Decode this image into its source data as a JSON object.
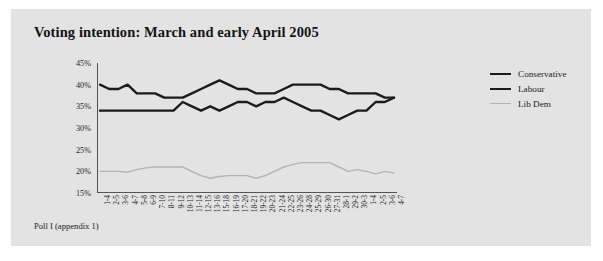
{
  "figure": {
    "title": "Voting intention: March and early April 2005",
    "caption": "Poll I (appendix 1)",
    "background": "#e3e3e3",
    "page_background": "#ffffff"
  },
  "legend": {
    "position": "right",
    "entries": [
      {
        "label": "Conservative",
        "color": "#1b1b1b",
        "width": 2.4
      },
      {
        "label": "Labour",
        "color": "#1b1b1b",
        "width": 2.4
      },
      {
        "label": "Lib Dem",
        "color": "#b3b3b3",
        "width": 1.4
      }
    ]
  },
  "chart_data": {
    "type": "line",
    "title": "Voting intention: March and early April 2005",
    "xlabel": "",
    "ylabel": "",
    "ylim": [
      15,
      45
    ],
    "yticks": [
      15,
      20,
      25,
      30,
      35,
      40,
      45
    ],
    "ytick_labels": [
      "15%",
      "20%",
      "25%",
      "30%",
      "35%",
      "40%",
      "45%"
    ],
    "grid": false,
    "legend_position": "right",
    "categories": [
      "1-4",
      "2-5",
      "3-6",
      "4-7",
      "5-8",
      "6-9",
      "7-10",
      "8-11",
      "9-12",
      "10-13",
      "11-14",
      "12-15",
      "13-16",
      "15-18",
      "16-19",
      "17-20",
      "18-21",
      "19-22",
      "20-23",
      "21-24",
      "22-25",
      "23-26",
      "24-28",
      "25-29",
      "26-30",
      "27-31",
      "28-1",
      "29-2",
      "30-3",
      "1-4",
      "2-5",
      "3-6",
      "4-7"
    ],
    "series": [
      {
        "name": "Conservative",
        "color": "#1b1b1b",
        "values": [
          34,
          34,
          34,
          34,
          34,
          34,
          34,
          34,
          34,
          36,
          35,
          34,
          35,
          34,
          35,
          36,
          36,
          35,
          36,
          36,
          37,
          36,
          35,
          34,
          34,
          33,
          32,
          33,
          34,
          34,
          36,
          36,
          37
        ]
      },
      {
        "name": "Labour",
        "color": "#1b1b1b",
        "values": [
          40,
          39,
          39,
          40,
          38,
          38,
          38,
          37,
          37,
          37,
          38,
          39,
          40,
          41,
          40,
          39,
          39,
          38,
          38,
          38,
          39,
          40,
          40,
          40,
          40,
          39,
          39,
          38,
          38,
          38,
          38,
          37,
          37
        ]
      },
      {
        "name": "Lib Dem",
        "color": "#b3b3b3",
        "values": [
          20,
          20,
          20,
          19.8,
          20.4,
          20.8,
          21,
          21,
          21,
          21,
          20,
          19,
          18.4,
          18.8,
          19,
          19,
          19,
          18.4,
          19,
          20,
          21,
          21.6,
          22,
          22,
          22,
          22,
          21,
          20,
          20.4,
          20,
          19.4,
          20,
          19.6
        ]
      }
    ]
  }
}
